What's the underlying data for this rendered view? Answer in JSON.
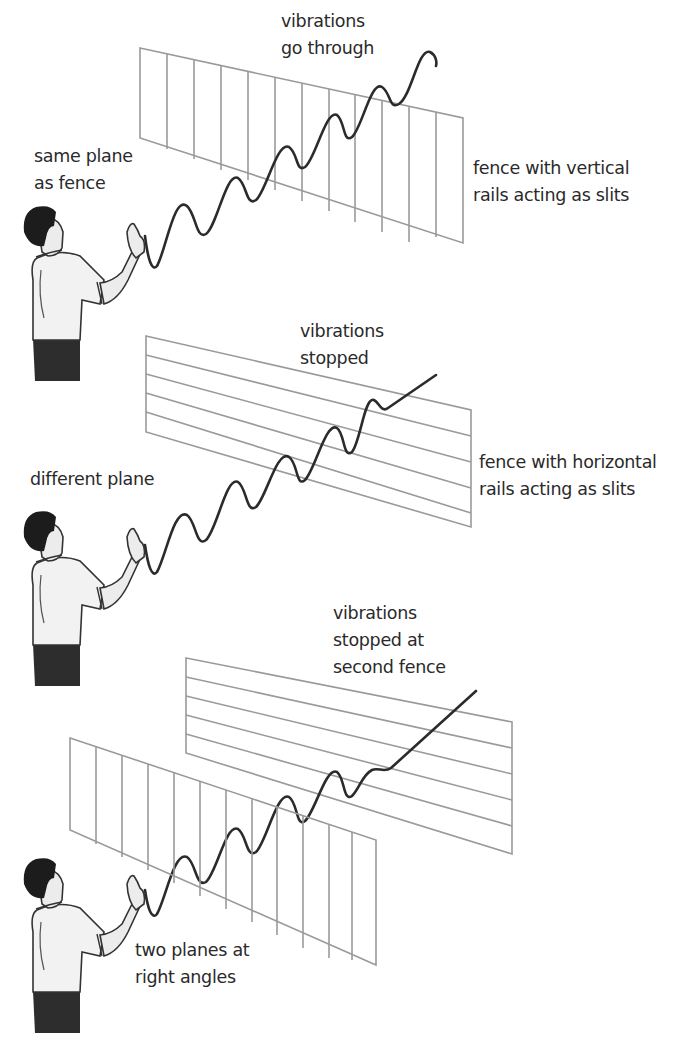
{
  "diagram": {
    "panels": [
      {
        "id": "panel-1",
        "person_label": [
          "same plane",
          "as fence"
        ],
        "result_label": [
          "vibrations",
          "go through"
        ],
        "fence_label": [
          "fence with vertical",
          "rails acting as slits"
        ],
        "fence_orientation": "vertical"
      },
      {
        "id": "panel-2",
        "person_label": [
          "different plane"
        ],
        "result_label": [
          "vibrations",
          "stopped"
        ],
        "fence_label": [
          "fence with horizontal",
          "rails acting as slits"
        ],
        "fence_orientation": "horizontal"
      },
      {
        "id": "panel-3",
        "person_label": [
          "two planes at",
          "right angles"
        ],
        "result_label": [
          "vibrations",
          "stopped at",
          "second fence"
        ],
        "fence_orientation": "vertical then horizontal"
      }
    ],
    "colors": {
      "fence": "#9a9a9a",
      "wave": "#2b2b2b",
      "text": "#2a2a2a",
      "background": "#ffffff"
    }
  }
}
